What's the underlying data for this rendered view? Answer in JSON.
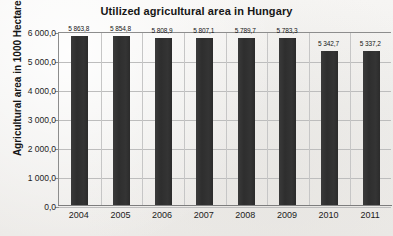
{
  "chart_data": {
    "type": "bar",
    "title": "Utilized agricultural area in Hungary",
    "xlabel": "",
    "ylabel": "Agricultural area in 1000 Hectares",
    "categories": [
      "2004",
      "2005",
      "2006",
      "2007",
      "2008",
      "2009",
      "2010",
      "2011"
    ],
    "values": [
      5863.8,
      5854.8,
      5808.9,
      5807.1,
      5789.7,
      5783.3,
      5342.7,
      5337.2
    ],
    "value_labels": [
      "5 863,8",
      "5 854,8",
      "5 808,9",
      "5 807,1",
      "5 789,7",
      "5 783,3",
      "5 342,7",
      "5 337,2"
    ],
    "ylim": [
      0,
      6000
    ],
    "ytick_values": [
      0,
      1000,
      2000,
      3000,
      4000,
      5000,
      6000
    ],
    "ytick_labels": [
      "0,0",
      "1 000,0",
      "2 000,0",
      "3 000,0",
      "4 000,0",
      "5 000,0",
      "6 000,0"
    ],
    "grid": true,
    "legend": "none",
    "bar_color": "#313131",
    "gridline_color": "#bdbdbd",
    "axis_color": "#8d8d8d",
    "background_color": "#f2f1ef"
  },
  "artifact": {
    "margin_speck": "ʌ"
  }
}
